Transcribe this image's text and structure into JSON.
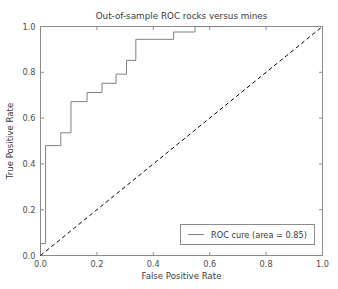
{
  "chart_data": {
    "type": "line",
    "title": "Out-of-sample ROC rocks versus mines",
    "xlabel": "False Positive Rate",
    "ylabel": "True Positive Rate",
    "xlim": [
      0.0,
      1.0
    ],
    "ylim": [
      0.0,
      1.0
    ],
    "xticks": [
      "0.0",
      "0.2",
      "0.4",
      "0.6",
      "0.8",
      "1.0"
    ],
    "xtick_values": [
      0.0,
      0.2,
      0.4,
      0.6,
      0.8,
      1.0
    ],
    "yticks": [
      "0.0",
      "0.2",
      "0.4",
      "0.6",
      "0.8",
      "1.0"
    ],
    "ytick_values": [
      0.0,
      0.2,
      0.4,
      0.6,
      0.8,
      1.0
    ],
    "grid": false,
    "legend_position": "lower right",
    "series": [
      {
        "name": "ROC cure (area = 0.85)",
        "style": "step",
        "linestyle": "solid",
        "color": "#808080",
        "auc": 0.85,
        "points": [
          [
            0.0,
            0.0
          ],
          [
            0.0,
            0.052
          ],
          [
            0.018,
            0.052
          ],
          [
            0.018,
            0.48
          ],
          [
            0.072,
            0.48
          ],
          [
            0.072,
            0.536
          ],
          [
            0.108,
            0.536
          ],
          [
            0.108,
            0.672
          ],
          [
            0.165,
            0.672
          ],
          [
            0.165,
            0.712
          ],
          [
            0.218,
            0.712
          ],
          [
            0.218,
            0.752
          ],
          [
            0.268,
            0.752
          ],
          [
            0.268,
            0.792
          ],
          [
            0.305,
            0.792
          ],
          [
            0.305,
            0.852
          ],
          [
            0.338,
            0.852
          ],
          [
            0.338,
            0.944
          ],
          [
            0.472,
            0.944
          ],
          [
            0.472,
            0.976
          ],
          [
            0.548,
            0.976
          ],
          [
            0.548,
            1.0
          ],
          [
            0.66,
            1.0
          ]
        ]
      },
      {
        "name": "chance-diagonal",
        "style": "line",
        "linestyle": "dashed",
        "color": "#000000",
        "points": [
          [
            0.0,
            0.0
          ],
          [
            1.0,
            1.0
          ]
        ]
      }
    ],
    "legend_entries": [
      {
        "label": "ROC cure (area = 0.85)",
        "color": "#808080",
        "linestyle": "solid"
      }
    ]
  },
  "axes": {
    "frame_color": "#8c8c8c",
    "tick_color": "#8c8c8c"
  }
}
